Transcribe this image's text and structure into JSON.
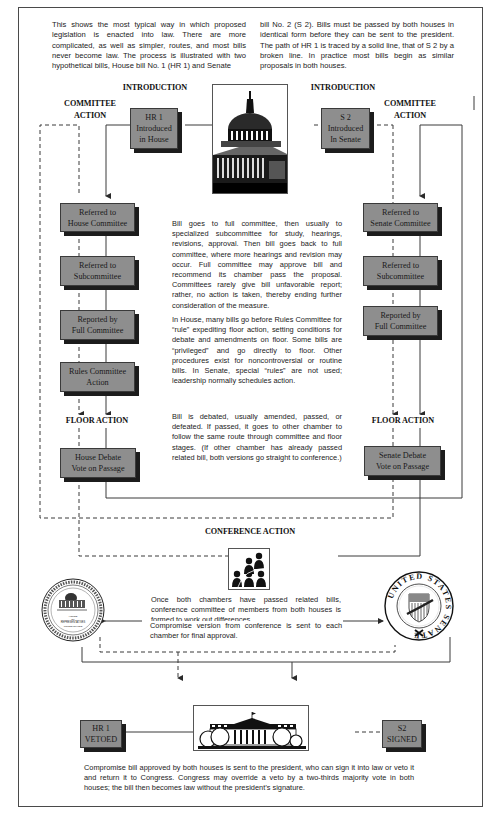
{
  "intro": {
    "left_paragraph": "This shows the most typical way in which proposed legislation is enacted into law. There are more complicated, as well as simpler, routes, and most bills never become law. The process is illustrated with two hypothetical bills, House bill No. 1 (HR 1) and Senate",
    "right_paragraph": "bill No. 2 (S 2). Bills must be passed by both houses in identical form before they can be sent to the president. The path of HR 1 is traced by a solid line, that of S 2 by a broken line. In practice most bills begin as similar proposals in both houses."
  },
  "stages": {
    "introduction_left": "INTRODUCTION",
    "introduction_right": "INTRODUCTION",
    "committee_left_1": "COMMITTEE",
    "committee_left_2": "ACTION",
    "committee_right_1": "COMMITTEE",
    "committee_right_2": "ACTION",
    "floor_left": "FLOOR ACTION",
    "floor_right": "FLOOR ACTION",
    "conference": "CONFERENCE ACTION"
  },
  "house_boxes": [
    {
      "line1": "HR 1",
      "line2": "Introduced",
      "line3": "in House"
    },
    {
      "line1": "Referred to",
      "line2": "House Committee"
    },
    {
      "line1": "Referred to",
      "line2": "Subcommittee"
    },
    {
      "line1": "Reported by",
      "line2": "Full Committee"
    },
    {
      "line1": "Rules Committee",
      "line2": "Action"
    },
    {
      "line1": "House Debate",
      "line2": "Vote on Passage"
    }
  ],
  "senate_boxes": [
    {
      "line1": "S 2",
      "line2": "Introduced",
      "line3": "In Senate"
    },
    {
      "line1": "Referred to",
      "line2": "Senate Committee"
    },
    {
      "line1": "Referred to",
      "line2": "Subcommittee"
    },
    {
      "line1": "Reported by",
      "line2": "Full Committee"
    },
    {
      "line1": "Senate Debate",
      "line2": "Vote on Passage"
    }
  ],
  "explanations": {
    "committee": "Bill goes to full committee, then usually to specialized subcommittee for study, hearings, revisions, approval. Then bill goes back to full committee, where more hearings and revision may occur. Full committee may approve bill and recommend its chamber pass the proposal. Committees rarely give bill unfavorable report; rather, no action is taken, thereby ending further consideration of the measure.",
    "rules": "In House, many bills go before Rules Committee for “rule” expediting floor action, setting conditions for debate and amendments on floor. Some bills are “privileged” and go directly to floor. Other procedures exist for noncontroversial or routine bills. In Senate, special “rules” are not used; leadership normally schedules action.",
    "floor": "Bill is debated, usually amended, passed, or defeated. If passed, it goes to other chamber to follow the same route through committee and floor stages. (If other chamber has already passed related bill, both versions go straight to conference.)",
    "conference": "Once both chambers have passed related bills, conference committee of members from both houses is formed to work out differences.",
    "compromise": "Compromise version from conference is sent to each chamber for final approval.",
    "president": "Compromise bill approved by both houses is sent to the president, who can sign it into law or veto it and return it to Congress. Congress may override a veto by a two-thirds majority vote in both houses; the bill then becomes law without the president’s signature."
  },
  "outcomes": {
    "hr1": {
      "line1": "HR 1",
      "line2": "VETOED"
    },
    "s2": {
      "line1": "S2",
      "line2": "SIGNED"
    }
  },
  "seals": {
    "house_text_1": "HOUSE",
    "house_text_2": "OF",
    "house_text_3": "REPRESENTATIVES",
    "house_text_4": "UNITED STATES",
    "senate_ring": "UNITED STATES SENATE"
  },
  "colors": {
    "box_fill": "#8e8e8e",
    "box_shadow": "#1c1c1c",
    "line": "#3a3a3a",
    "frame": "#4a4a4a"
  }
}
